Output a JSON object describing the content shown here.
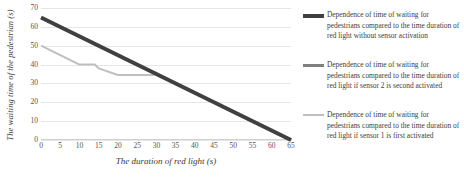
{
  "chart_data": {
    "type": "line",
    "title": "",
    "xlabel": "The duration of red light (s)",
    "ylabel": "The waiting time of the pedestrian (s)",
    "xlim": [
      0,
      65
    ],
    "ylim": [
      0,
      70
    ],
    "xticks": [
      0,
      5,
      10,
      15,
      20,
      25,
      30,
      35,
      40,
      45,
      50,
      55,
      60,
      65
    ],
    "yticks": [
      0,
      10,
      20,
      30,
      40,
      50,
      60,
      70
    ],
    "grid": "horizontal",
    "legend_position": "right",
    "series": [
      {
        "name": "Dependence of time of waiting for pedestrians compared to the time duration of red light without sensor activation",
        "color": "#404040",
        "width": 4,
        "x": [
          0,
          65
        ],
        "y": [
          65,
          0
        ]
      },
      {
        "name": "Dependence of time of waiting for pedestrians compared to the time duration of red light if sensor 2 is second activated",
        "color": "#808080",
        "width": 2.4,
        "x": [
          30,
          65
        ],
        "y": [
          35,
          0
        ]
      },
      {
        "name": "Dependence of time of waiting for pedestrians compared to the time duration of red light if sensor 1 is first activated",
        "color": "#bfbfbf",
        "width": 2,
        "x": [
          0,
          10,
          14,
          15,
          20,
          29,
          30,
          65
        ],
        "y": [
          50,
          40,
          40,
          38,
          34.5,
          34.5,
          35,
          0
        ]
      }
    ]
  },
  "legend": {
    "items": [
      {
        "color": "#404040",
        "label": "Dependence of time of waiting for pedestrians compared to the time duration of red light without sensor activation"
      },
      {
        "color": "#808080",
        "label": "Dependence of time of waiting for pedestrians compared to the time duration of red light if sensor 2 is second activated"
      },
      {
        "color": "#bfbfbf",
        "label": "Dependence of time of waiting for pedestrians compared to the time duration of red light if sensor 1 is first activated"
      }
    ]
  }
}
